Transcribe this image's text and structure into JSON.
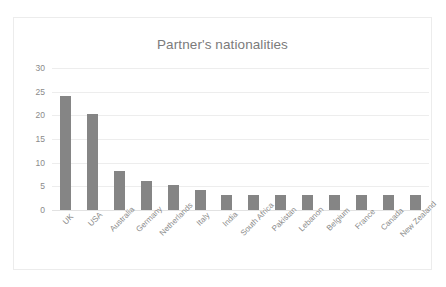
{
  "chart_data": {
    "type": "bar",
    "title": "Partner's nationalities",
    "xlabel": "",
    "ylabel": "",
    "ylim": [
      0,
      30
    ],
    "yticks": [
      0,
      5,
      10,
      15,
      20,
      25,
      30
    ],
    "grid": true,
    "legend": false,
    "bar_color": "#858585",
    "categories": [
      "UK",
      "USA",
      "Australia",
      "Germany",
      "Netherlands",
      "Italy",
      "India",
      "South Africa",
      "Pakistan",
      "Lebanon",
      "Belgium",
      "France",
      "Canada",
      "New Zealand"
    ],
    "values": [
      24,
      20.3,
      8.2,
      6.2,
      5.2,
      4.2,
      3.1,
      3.1,
      3.1,
      3.1,
      3.1,
      3.1,
      3.1,
      3.1
    ]
  }
}
